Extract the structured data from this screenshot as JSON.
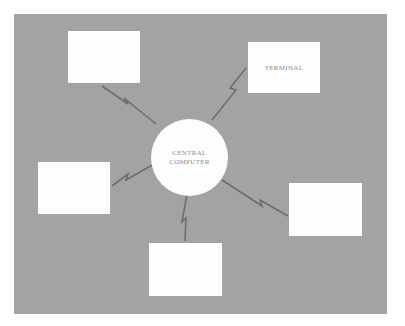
{
  "diagram": {
    "colors": {
      "background": "#a3a3a3",
      "node_fill": "#fdfdfd",
      "link": "#6e6e6e",
      "label": "#8a8a8a"
    },
    "hub": {
      "label_line1": "CENTRAL",
      "label_line2": "COMPUTER"
    },
    "terminals": [
      {
        "id": "top-left",
        "label": ""
      },
      {
        "id": "top-right",
        "label": "TERMINAL"
      },
      {
        "id": "left",
        "label": ""
      },
      {
        "id": "bottom",
        "label": ""
      },
      {
        "id": "right",
        "label": ""
      }
    ],
    "link_style": "lightning-bolt (wireless/telecom)"
  }
}
